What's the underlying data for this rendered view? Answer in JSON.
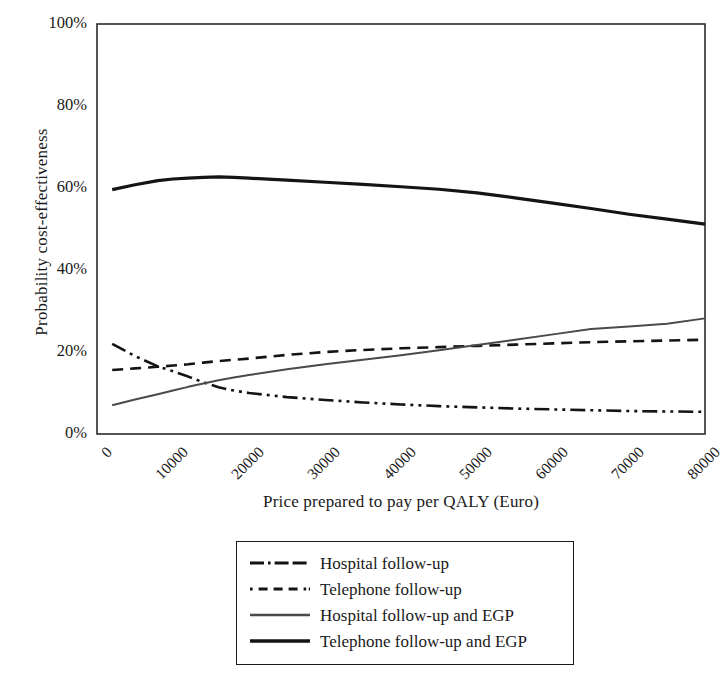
{
  "chart_data": {
    "type": "line",
    "title": "",
    "xlabel": "Price prepared to pay per QALY (Euro)",
    "ylabel": "Probability cost-effectiveness",
    "xlim": [
      0,
      80000
    ],
    "ylim": [
      0,
      100
    ],
    "grid": false,
    "legend_position": "below-center",
    "xticks": [
      "0",
      "10000",
      "20000",
      "30000",
      "40000",
      "50000",
      "60000",
      "70000",
      "80000"
    ],
    "xtick_values": [
      0,
      10000,
      20000,
      30000,
      40000,
      50000,
      60000,
      70000,
      80000
    ],
    "yticks": [
      "0%",
      "20%",
      "40%",
      "60%",
      "80%",
      "100%"
    ],
    "ytick_values": [
      0,
      20,
      40,
      60,
      80,
      100
    ],
    "x": [
      2000,
      5000,
      8000,
      10000,
      12000,
      14000,
      16000,
      18000,
      20000,
      25000,
      30000,
      35000,
      40000,
      45000,
      50000,
      55000,
      60000,
      65000,
      70000,
      75000,
      80000
    ],
    "series": [
      {
        "name": "Hospital follow-up",
        "style": "dash-dot-dot",
        "color": "#141414",
        "width": 2.6,
        "values": [
          22.0,
          19.0,
          16.5,
          15.3,
          14.0,
          12.6,
          11.4,
          10.6,
          10.0,
          9.0,
          8.3,
          7.7,
          7.2,
          6.8,
          6.5,
          6.2,
          6.0,
          5.8,
          5.6,
          5.5,
          5.4
        ]
      },
      {
        "name": "Telephone follow-up",
        "style": "dashed",
        "color": "#141414",
        "width": 2.6,
        "values": [
          15.6,
          16.0,
          16.4,
          16.7,
          17.0,
          17.4,
          17.8,
          18.1,
          18.4,
          19.3,
          20.0,
          20.5,
          20.9,
          21.2,
          21.5,
          21.8,
          22.1,
          22.4,
          22.6,
          22.8,
          23.0
        ]
      },
      {
        "name": "Hospital follow-up and EGP",
        "style": "solid-thin",
        "color": "#4a4a4a",
        "width": 2.0,
        "values": [
          7.0,
          8.4,
          9.7,
          10.6,
          11.5,
          12.3,
          13.1,
          13.8,
          14.4,
          15.8,
          17.0,
          18.1,
          19.2,
          20.4,
          21.7,
          23.0,
          24.3,
          25.6,
          26.2,
          26.9,
          28.2
        ]
      },
      {
        "name": "Telephone follow-up and EGP",
        "style": "solid-thick",
        "color": "#141414",
        "width": 3.2,
        "values": [
          59.6,
          60.8,
          61.8,
          62.2,
          62.4,
          62.6,
          62.7,
          62.6,
          62.4,
          61.9,
          61.4,
          60.9,
          60.3,
          59.7,
          58.8,
          57.6,
          56.3,
          55.0,
          53.6,
          52.4,
          51.2
        ]
      }
    ]
  },
  "legend": {
    "items": [
      {
        "label": "Hospital follow-up"
      },
      {
        "label": "Telephone follow-up"
      },
      {
        "label": "Hospital follow-up and EGP"
      },
      {
        "label": "Telephone follow-up and EGP"
      }
    ]
  }
}
